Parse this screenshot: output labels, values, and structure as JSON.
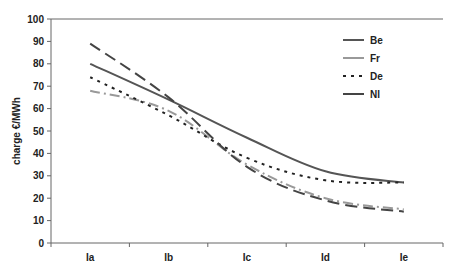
{
  "chart_data": {
    "type": "line",
    "title": "",
    "xlabel": "",
    "ylabel": "charge €/MWh",
    "categories": [
      "Ia",
      "Ib",
      "Ic",
      "Id",
      "Ie"
    ],
    "ylim": [
      0,
      100
    ],
    "yticks": [
      0,
      10,
      20,
      30,
      40,
      50,
      60,
      70,
      80,
      90,
      100
    ],
    "grid": false,
    "legend_position": "upper-right-inside",
    "series": [
      {
        "name": "Be",
        "values": [
          80,
          64,
          47,
          32,
          27
        ],
        "style": "solid",
        "color": "#555555"
      },
      {
        "name": "Fr",
        "values": [
          68,
          59,
          35,
          20,
          15
        ],
        "style": "dash-dot",
        "color": "#999999"
      },
      {
        "name": "De",
        "values": [
          74,
          57,
          38,
          28,
          27
        ],
        "style": "dotted",
        "color": "#222222"
      },
      {
        "name": "Nl",
        "values": [
          89,
          65,
          34,
          19,
          14
        ],
        "style": "long-dash",
        "color": "#444444"
      }
    ]
  }
}
